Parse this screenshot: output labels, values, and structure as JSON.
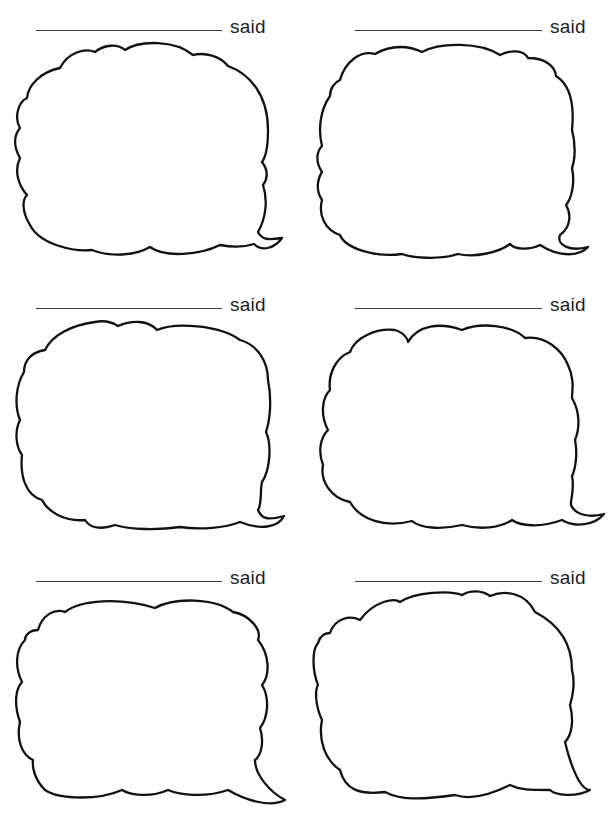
{
  "worksheet": {
    "panels": [
      {
        "said_label": "said",
        "name_value": "",
        "speech_value": ""
      },
      {
        "said_label": "said",
        "name_value": "",
        "speech_value": ""
      },
      {
        "said_label": "said",
        "name_value": "",
        "speech_value": ""
      },
      {
        "said_label": "said",
        "name_value": "",
        "speech_value": ""
      },
      {
        "said_label": "said",
        "name_value": "",
        "speech_value": ""
      },
      {
        "said_label": "said",
        "name_value": "",
        "speech_value": ""
      }
    ]
  },
  "colors": {
    "background": "#ffffff",
    "outline": "#111111",
    "line": "#3a3a3a",
    "text": "#1e1e1e"
  }
}
